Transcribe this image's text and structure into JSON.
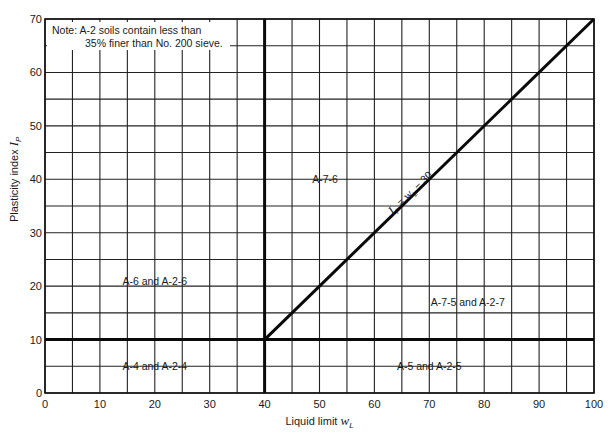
{
  "chart_data": {
    "type": "line",
    "title": "",
    "xlabel": "Liquid limit w_L",
    "xlabel_main": "Liquid limit ",
    "xlabel_var": "w",
    "xlabel_sub": "L",
    "ylabel": "Plasticity index I_P",
    "ylabel_main": "Plasticity index ",
    "ylabel_var": "I",
    "ylabel_sub": "P",
    "xlim": [
      0,
      100
    ],
    "ylim": [
      0,
      70
    ],
    "x_ticks": [
      0,
      10,
      20,
      30,
      40,
      50,
      60,
      70,
      80,
      90,
      100
    ],
    "y_ticks": [
      0,
      10,
      20,
      30,
      40,
      50,
      60,
      70
    ],
    "grid": {
      "on": true,
      "x_step": 5,
      "y_step": 5
    },
    "boundary_lines": [
      {
        "name": "vertical boundary",
        "points": [
          [
            40,
            0
          ],
          [
            40,
            70
          ]
        ]
      },
      {
        "name": "horizontal boundary",
        "points": [
          [
            0,
            10
          ],
          [
            100,
            10
          ]
        ]
      },
      {
        "name": "I_P = w_L - 30",
        "points": [
          [
            40,
            10
          ],
          [
            100,
            70
          ]
        ]
      }
    ],
    "line_label": {
      "text": "I_P = w_L − 30",
      "var1": "I",
      "sub1": "P",
      "eq": " = ",
      "var2": "w",
      "sub2": "L",
      "rest": " − 30",
      "x": 67,
      "y": 37
    },
    "regions": [
      {
        "label": "A-7-6",
        "x": 51,
        "y": 40
      },
      {
        "label": "A-6 and A-2-6",
        "x": 20,
        "y": 21
      },
      {
        "label": "A-7-5 and A-2-7",
        "x": 77,
        "y": 17
      },
      {
        "label": "A-4 and A-2-4",
        "x": 20,
        "y": 5
      },
      {
        "label": "A-5 and A-2-5",
        "x": 70,
        "y": 5
      }
    ],
    "note": {
      "line1": "Note:  A-2 soils contain less than",
      "line2": "35% finer than No. 200 sieve."
    }
  }
}
